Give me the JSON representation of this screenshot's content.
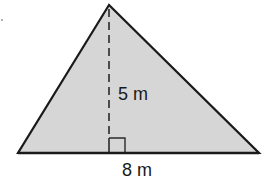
{
  "diagram": {
    "shape": "triangle",
    "fill_color": "#d6d6d6",
    "stroke_color": "#1a1a1a",
    "vertices": {
      "apex": [
        109,
        5
      ],
      "base_left": [
        18,
        153
      ],
      "base_right": [
        259,
        153
      ]
    },
    "height_line": {
      "style": "dashed",
      "from": [
        109,
        5
      ],
      "to": [
        109,
        153
      ]
    },
    "right_angle_marker": {
      "x": 109,
      "y": 138,
      "size": 16
    },
    "labels": {
      "height": "5 m",
      "base": "8 m"
    },
    "dimensions": {
      "height": 5,
      "base": 8,
      "unit": "m"
    }
  }
}
